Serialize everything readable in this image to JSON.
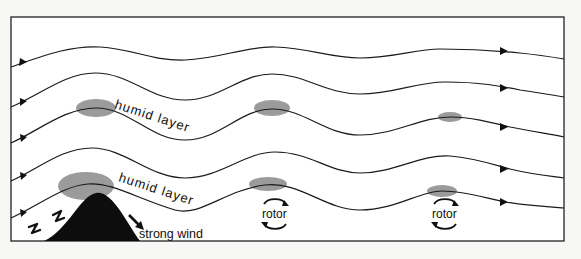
{
  "diagram": {
    "labels": {
      "humid_layer_upper": "humid layer",
      "humid_layer_lower": "humid layer",
      "rotor_1": "rotor",
      "rotor_2": "rotor",
      "strong_wind": "strong wind"
    },
    "streamlines_count": 5,
    "colors": {
      "background": "#f7f7f5",
      "frame": "#222222",
      "streamline": "#1a1a1a",
      "cloud": "#8a8a8a",
      "mountain": "#0d0d0d"
    },
    "icons": {
      "flow_arrow": "triangle-arrowhead",
      "rotor_arrows": "circular-arrows",
      "turbulence": "zigzag-arrow"
    }
  }
}
